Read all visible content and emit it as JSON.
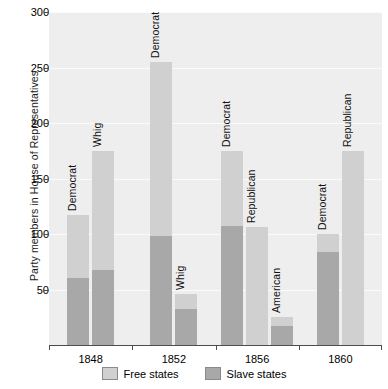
{
  "chart_data": {
    "type": "bar",
    "title": "",
    "subtitle": "",
    "xlabel": "",
    "ylabel": "Party members in House of Representatives",
    "ylim": [
      0,
      300
    ],
    "yticks": [
      50,
      100,
      150,
      200,
      250,
      300
    ],
    "ytick_labels": [
      "50",
      "100",
      "150",
      "200",
      "250",
      "300"
    ],
    "grid": true,
    "stacked": true,
    "legend_position": "bottom-center",
    "categories": [
      "1848",
      "1852",
      "1856",
      "1860"
    ],
    "series": [
      {
        "name": "Free states",
        "color": "#d0d0d0"
      },
      {
        "name": "Slave states",
        "color": "#a8a8a8"
      }
    ],
    "groups": [
      {
        "category": "1848",
        "bars": [
          {
            "label": "Democrat",
            "total": 117,
            "slave_states": 60,
            "free_states": 57
          },
          {
            "label": "Whig",
            "total": 175,
            "slave_states": 68,
            "free_states": 107
          }
        ]
      },
      {
        "category": "1852",
        "bars": [
          {
            "label": "Democrat",
            "total": 255,
            "slave_states": 98,
            "free_states": 157
          },
          {
            "label": "Whig",
            "total": 46,
            "slave_states": 32,
            "free_states": 14
          }
        ]
      },
      {
        "category": "1856",
        "bars": [
          {
            "label": "Democrat",
            "total": 175,
            "slave_states": 107,
            "free_states": 68
          },
          {
            "label": "Republican",
            "total": 106,
            "slave_states": 0,
            "free_states": 106
          },
          {
            "label": "American",
            "total": 25,
            "slave_states": 17,
            "free_states": 8
          }
        ]
      },
      {
        "category": "1860",
        "bars": [
          {
            "label": "Democrat",
            "total": 100,
            "slave_states": 84,
            "free_states": 16
          },
          {
            "label": "Republican",
            "total": 175,
            "slave_states": 0,
            "free_states": 175
          }
        ]
      }
    ]
  },
  "legend": {
    "items": [
      {
        "label": "Free states",
        "color": "#d0d0d0"
      },
      {
        "label": "Slave states",
        "color": "#a8a8a8"
      }
    ]
  },
  "axis": {
    "y_title": "Party members in House of Representatives"
  }
}
